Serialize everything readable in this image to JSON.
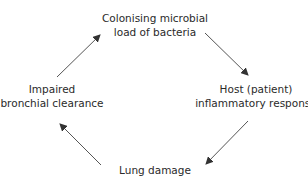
{
  "diagram": {
    "type": "cycle",
    "nodes": [
      {
        "id": "colonising",
        "lines": [
          "Colonising microbial",
          "load of bacteria"
        ]
      },
      {
        "id": "host",
        "lines": [
          "Host (patient)",
          "inflammatory response"
        ]
      },
      {
        "id": "lung",
        "lines": [
          "Lung damage"
        ]
      },
      {
        "id": "impaired",
        "lines": [
          "Impaired",
          "bronchial clearance"
        ]
      }
    ],
    "edges": [
      {
        "from": "colonising",
        "to": "host"
      },
      {
        "from": "host",
        "to": "lung"
      },
      {
        "from": "lung",
        "to": "impaired"
      },
      {
        "from": "impaired",
        "to": "colonising"
      }
    ],
    "colors": {
      "text": "#2a2a2a",
      "arrow": "#555555"
    }
  }
}
